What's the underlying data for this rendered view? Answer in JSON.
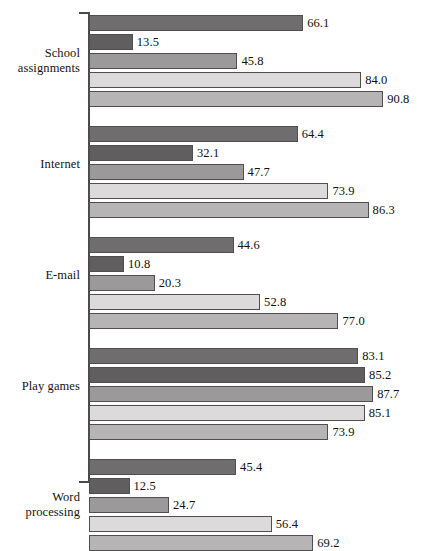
{
  "chart_data": {
    "type": "bar",
    "orientation": "horizontal",
    "title": "",
    "subtitle": "",
    "xlabel": "",
    "ylabel": "",
    "xlim": [
      0,
      100
    ],
    "grid": false,
    "legend_position": "none",
    "categories": [
      "School\nassignments",
      "Internet",
      "E-mail",
      "Play games",
      "Word\nprocessing"
    ],
    "series": [
      {
        "name": "Series 1",
        "color": "#6f6d6d",
        "values": [
          66.1,
          64.4,
          44.6,
          83.1,
          45.4
        ]
      },
      {
        "name": "Series 2",
        "color": "#605e5e",
        "values": [
          13.5,
          32.1,
          10.8,
          85.2,
          12.5
        ]
      },
      {
        "name": "Series 3",
        "color": "#9b9999",
        "values": [
          45.8,
          47.7,
          20.3,
          87.7,
          24.7
        ]
      },
      {
        "name": "Series 4",
        "color": "#dcdada",
        "values": [
          84.0,
          73.9,
          52.8,
          85.1,
          56.4
        ]
      },
      {
        "name": "Series 5",
        "color": "#b6b4b4",
        "values": [
          90.8,
          86.3,
          77.0,
          73.9,
          69.2
        ]
      }
    ],
    "value_labels": [
      [
        "66.1",
        "13.5",
        "45.8",
        "84.0",
        "90.8"
      ],
      [
        "64.4",
        "32.1",
        "47.7",
        "73.9",
        "86.3"
      ],
      [
        "44.6",
        "10.8",
        "20.3",
        "52.8",
        "77.0"
      ],
      [
        "83.1",
        "85.2",
        "87.7",
        "85.1",
        "73.9"
      ],
      [
        "45.4",
        "12.5",
        "24.7",
        "56.4",
        "69.2"
      ]
    ],
    "axis_color": "#4a4a4a",
    "bar_border_color": "#4f4f4f",
    "background_color": "#ffffff"
  },
  "labels": {
    "group_0": "School\nassignments",
    "group_1": "Internet",
    "group_2": "E-mail",
    "group_3": "Play games",
    "group_4": "Word\nprocessing"
  }
}
